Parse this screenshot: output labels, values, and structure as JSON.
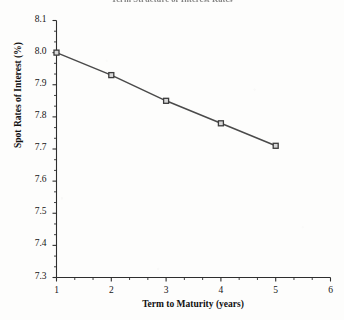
{
  "document": {
    "background_color": "#fdfdfc",
    "ink_color": "#1a1a1a"
  },
  "chart_data": {
    "type": "line",
    "title": "Term Structure of Interest Rates",
    "title_clipped": true,
    "xlabel": "Term to Maturity (years)",
    "ylabel": "Spot Rates of Interest (%)",
    "x": [
      1,
      2,
      3,
      4,
      5
    ],
    "values": [
      8.0,
      7.93,
      7.85,
      7.78,
      7.71
    ],
    "series": [
      {
        "name": "Spot Rate",
        "x": [
          1,
          2,
          3,
          4,
          5
        ],
        "values": [
          8.0,
          7.93,
          7.85,
          7.78,
          7.71
        ]
      }
    ],
    "xlim": [
      1,
      6
    ],
    "ylim": [
      7.3,
      8.1
    ],
    "xticks": [
      1,
      2,
      3,
      4,
      5,
      6
    ],
    "yticks": [
      7.3,
      7.4,
      7.5,
      7.6,
      7.7,
      7.8,
      7.9,
      8.0,
      8.1
    ],
    "xtick_labels": [
      "1",
      "2",
      "3",
      "4",
      "5",
      "6"
    ],
    "ytick_labels": [
      "7.3",
      "7.4",
      "7.5",
      "7.6",
      "7.7",
      "7.8",
      "7.9",
      "8.0",
      "8.1"
    ],
    "minor_ticks": true,
    "minor_ticks_per_interval": 2,
    "grid": false,
    "legend": false,
    "legend_position": "none",
    "line_color": "#4a4a4a",
    "marker": "square",
    "marker_edge_color": "#3c3c3c",
    "marker_face_color": "#d8d8d8",
    "marker_size": 5
  }
}
